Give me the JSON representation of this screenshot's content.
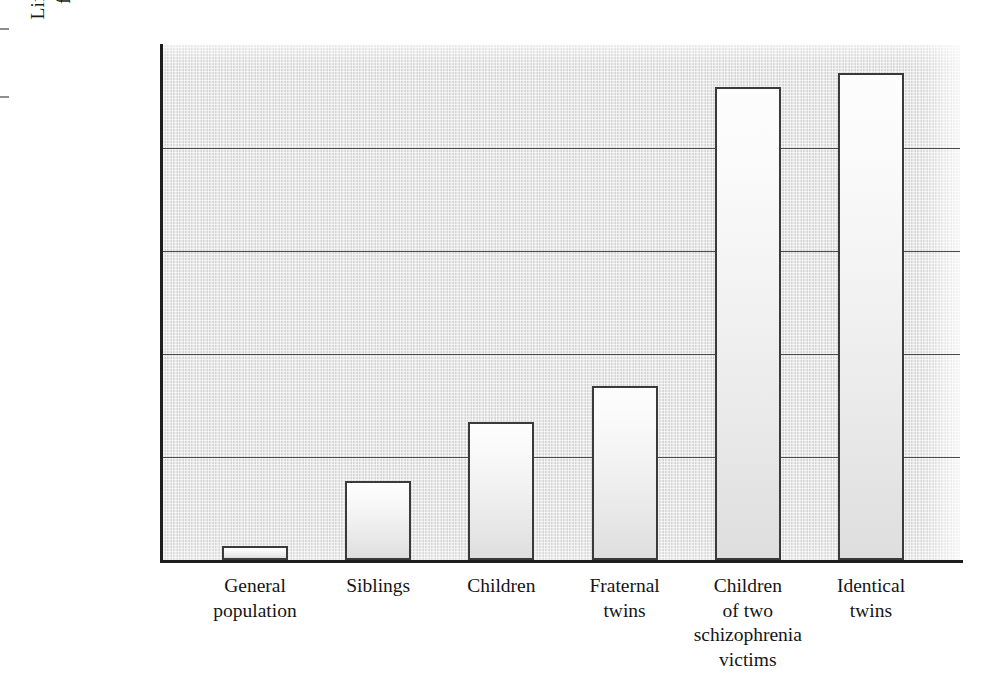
{
  "chart_data": {
    "type": "bar",
    "title": "",
    "subtitle": "",
    "xlabel": "",
    "ylabel": "Lifetime risk of developing schizophrenia for relatives of a schizophrenia victim",
    "ylabel_lines": [
      "Lifetime risk of developing schizophrenia",
      "for relatives of a schizophrenia victim"
    ],
    "categories": [
      "General population",
      "Siblings",
      "Children",
      "Fraternal twins",
      "Children of two schizophrenia victims",
      "Identical twins"
    ],
    "category_label_lines": [
      [
        "General",
        "population"
      ],
      [
        "Siblings"
      ],
      [
        "Children"
      ],
      [
        "Fraternal",
        "twins"
      ],
      [
        "Children",
        "of two",
        "schizophrenia",
        "victims"
      ],
      [
        "Identical",
        "twins"
      ]
    ],
    "values": [
      1.4,
      7.7,
      13.4,
      16.9,
      45.9,
      47.3
    ],
    "value_unit": "%",
    "ylim": [
      0,
      50
    ],
    "ytick_values": [
      0,
      10,
      20,
      30,
      40,
      50
    ],
    "ytick_labels": [
      "0%",
      "10%",
      "20%",
      "30%",
      "40%",
      "50%"
    ],
    "grid": "horizontal",
    "legend": "none",
    "annotations": [],
    "colors": {
      "plot_background": "#e2e2e2",
      "bar_fill_top": "#fdfdfd",
      "bar_fill_bottom": "#dedede",
      "bar_border": "#3a3a3a",
      "axis": "#1d1d1d",
      "gridline": "#4a4a4a",
      "text": "#151515"
    }
  }
}
